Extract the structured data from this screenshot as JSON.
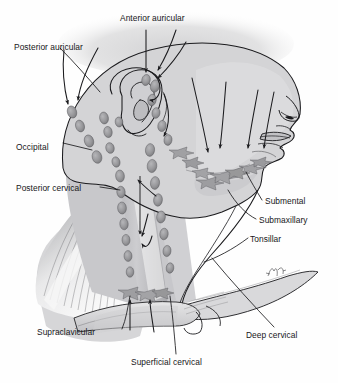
{
  "figure": {
    "style": "grayscale medical line illustration with stippled shading",
    "width": 338,
    "height": 383
  },
  "colors": {
    "background": "#fefefe",
    "skin_fill": "#d3d3d5",
    "skin_fill_light": "#dededf",
    "hair_blur": "#d8d8d9",
    "node_fill": "#9a9a9c",
    "node_fill_dark": "#7d7d80",
    "outline": "#1b1b1e",
    "muscle_shade": "#a8a8ab",
    "highlight": "#f4f4f4",
    "label_text": "#17171a"
  },
  "labels": [
    {
      "id": "anterior-auricular",
      "text": "Anterior auricular",
      "x": 120,
      "y": 13
    },
    {
      "id": "posterior-auricular",
      "text": "Posterior auricular",
      "x": 14,
      "y": 42
    },
    {
      "id": "occipital",
      "text": "Occipital",
      "x": 16,
      "y": 142
    },
    {
      "id": "posterior-cervical",
      "text": "Posterior cervical",
      "x": 16,
      "y": 183
    },
    {
      "id": "submental",
      "text": "Submental",
      "x": 265,
      "y": 196
    },
    {
      "id": "submaxillary",
      "text": "Submaxillary",
      "x": 259,
      "y": 215
    },
    {
      "id": "tonsillar",
      "text": "Tonsillar",
      "x": 250,
      "y": 234
    },
    {
      "id": "supraclavicular",
      "text": "Supraclavicular",
      "x": 37,
      "y": 327
    },
    {
      "id": "superficial-cervical",
      "text": "Superficial cervical",
      "x": 131,
      "y": 357
    },
    {
      "id": "deep-cervical",
      "text": "Deep cervical",
      "x": 246,
      "y": 330
    }
  ],
  "node_groups": [
    {
      "id": "anterior-auricular-nodes",
      "label": "Anterior auricular",
      "count": 6,
      "shape": "oval-chain"
    },
    {
      "id": "posterior-auricular-nodes",
      "label": "Posterior auricular",
      "count": 5,
      "shape": "oval-chain"
    },
    {
      "id": "occipital-nodes",
      "label": "Occipital",
      "count": 4,
      "shape": "oval-chain"
    },
    {
      "id": "posterior-cervical-nodes",
      "label": "Posterior cervical",
      "count": 7,
      "shape": "oval-chain"
    },
    {
      "id": "superficial-cervical-nodes",
      "label": "Superficial cervical",
      "count": 8,
      "shape": "oval-chain"
    },
    {
      "id": "submental-nodes",
      "label": "Submental",
      "count": 2,
      "shape": "stellate"
    },
    {
      "id": "submaxillary-nodes",
      "label": "Submaxillary",
      "count": 3,
      "shape": "stellate"
    },
    {
      "id": "tonsillar-nodes",
      "label": "Tonsillar",
      "count": 3,
      "shape": "stellate"
    },
    {
      "id": "supraclavicular-nodes",
      "label": "Supraclavicular",
      "count": 3,
      "shape": "stellate"
    }
  ],
  "drainage_arrows": {
    "description": "curved arrows indicating direction of lymphatic drainage toward the nodal chains",
    "count": 16
  },
  "signature": {
    "present": true,
    "x": 272,
    "y": 272
  }
}
